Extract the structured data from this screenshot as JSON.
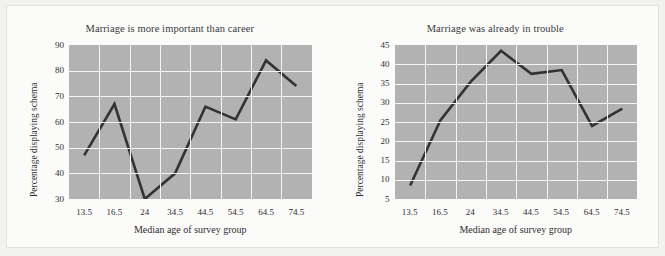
{
  "figure": {
    "background_color": "#f2f2f0",
    "card_color": "#fbfbfa",
    "panel_color": "#b2b2b2",
    "gridline_color": "#f4f4f2",
    "line_color": "#333333"
  },
  "chart_data": [
    {
      "type": "line",
      "title": "Marriage is more important than career",
      "xlabel": "Median age of survey group",
      "ylabel": "Percentage displaying schema",
      "categories": [
        "13.5",
        "16.5",
        "24",
        "34.5",
        "44.5",
        "54.5",
        "64.5",
        "74.5"
      ],
      "values": [
        47,
        67,
        30,
        40,
        66,
        61,
        84,
        74
      ],
      "yticks": [
        "30",
        "40",
        "50",
        "60",
        "70",
        "80",
        "90"
      ],
      "ytick_values": [
        30,
        40,
        50,
        60,
        70,
        80,
        90
      ],
      "ylim": [
        30,
        90
      ],
      "grid": true,
      "legend": "none",
      "series": [
        {
          "name": "Marriage is more important than career",
          "values": [
            47,
            67,
            30,
            40,
            66,
            61,
            84,
            74
          ]
        }
      ]
    },
    {
      "type": "line",
      "title": "Marriage was already in trouble",
      "xlabel": "Median age of survey group",
      "ylabel": "Percentage displaying schema",
      "categories": [
        "13.5",
        "16.5",
        "24",
        "34.5",
        "44.5",
        "54.5",
        "64.5",
        "74.5"
      ],
      "values": [
        8.5,
        25.5,
        35.5,
        43.5,
        37.5,
        38.5,
        24,
        28.5
      ],
      "yticks": [
        "5",
        "10",
        "15",
        "20",
        "25",
        "30",
        "35",
        "40",
        "45"
      ],
      "ytick_values": [
        5,
        10,
        15,
        20,
        25,
        30,
        35,
        40,
        45
      ],
      "ylim": [
        5,
        45
      ],
      "grid": true,
      "legend": "none",
      "series": [
        {
          "name": "Marriage was already in trouble",
          "values": [
            8.5,
            25.5,
            35.5,
            43.5,
            37.5,
            38.5,
            24,
            28.5
          ]
        }
      ]
    }
  ]
}
